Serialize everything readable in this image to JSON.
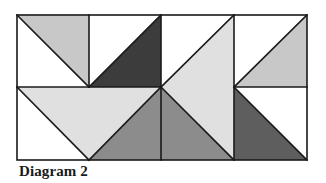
{
  "caption": "Diagram 2",
  "colors": {
    "white": "#ffffff",
    "light_grey": "#e0e0e0",
    "mid_light_grey": "#c8c8c8",
    "medium_grey": "#8c8c8c",
    "dark_grey": "#5e5e5e",
    "darkest_grey": "#3c3c3c",
    "line": "#1a1a1a"
  },
  "grid": {
    "x": [
      17,
      89,
      161,
      234,
      307
    ],
    "y": [
      15,
      87,
      160
    ]
  },
  "shapes": [
    {
      "name": "c1-top-white-triangle",
      "points": "17,15 89,87 17,87",
      "fill": "white"
    },
    {
      "name": "c1-top-grey-triangle",
      "points": "17,15 89,15 89,87",
      "fill": "mid_light_grey"
    },
    {
      "name": "c2-top-white-triangle",
      "points": "89,15 161,15 89,87",
      "fill": "white"
    },
    {
      "name": "c2-top-dark-triangle",
      "points": "161,15 161,87 89,87",
      "fill": "darkest_grey"
    },
    {
      "name": "c3-white-triangle",
      "points": "161,15 234,15 161,87",
      "fill": "white"
    },
    {
      "name": "c3-light-triangle",
      "points": "234,15 234,160 161,87",
      "fill": "light_grey"
    },
    {
      "name": "c3-medium-triangle",
      "points": "161,87 234,160 161,160",
      "fill": "medium_grey"
    },
    {
      "name": "c4-top-white-triangle",
      "points": "234,15 307,15 234,87",
      "fill": "white"
    },
    {
      "name": "c4-top-grey-triangle",
      "points": "307,15 307,87 234,87",
      "fill": "mid_light_grey"
    },
    {
      "name": "c4-bottom-white-triangle",
      "points": "234,87 307,87 307,160",
      "fill": "white"
    },
    {
      "name": "c4-bottom-dark-triangle",
      "points": "234,87 307,160 234,160",
      "fill": "dark_grey"
    },
    {
      "name": "bottom-left-white-triangle",
      "points": "17,87 89,160 17,160",
      "fill": "white"
    },
    {
      "name": "bottom-left-light-triangle",
      "points": "17,87 161,87 89,160",
      "fill": "light_grey"
    },
    {
      "name": "bottom-left-medium-triangle",
      "points": "161,87 161,160 89,160",
      "fill": "medium_grey"
    }
  ],
  "lines": [
    {
      "name": "outer-border",
      "type": "rect",
      "x": 17,
      "y": 15,
      "w": 290,
      "h": 145
    },
    {
      "name": "v-line-89-top",
      "x1": 89,
      "y1": 15,
      "x2": 89,
      "y2": 87
    },
    {
      "name": "v-line-161",
      "x1": 161,
      "y1": 15,
      "x2": 161,
      "y2": 160
    },
    {
      "name": "v-line-234",
      "x1": 234,
      "y1": 15,
      "x2": 234,
      "y2": 160
    },
    {
      "name": "h-line-left",
      "x1": 17,
      "y1": 87,
      "x2": 161,
      "y2": 87
    },
    {
      "name": "h-line-right",
      "x1": 234,
      "y1": 87,
      "x2": 307,
      "y2": 87
    },
    {
      "name": "diag-c1-top",
      "x1": 17,
      "y1": 15,
      "x2": 89,
      "y2": 87
    },
    {
      "name": "diag-c2-top",
      "x1": 161,
      "y1": 15,
      "x2": 89,
      "y2": 87
    },
    {
      "name": "diag-c3-top",
      "x1": 234,
      "y1": 15,
      "x2": 161,
      "y2": 87
    },
    {
      "name": "diag-c3-bottom",
      "x1": 161,
      "y1": 87,
      "x2": 234,
      "y2": 160
    },
    {
      "name": "diag-c4-top",
      "x1": 307,
      "y1": 15,
      "x2": 234,
      "y2": 87
    },
    {
      "name": "diag-c4-bottom",
      "x1": 234,
      "y1": 87,
      "x2": 307,
      "y2": 160
    },
    {
      "name": "diag-bottom-left-1",
      "x1": 17,
      "y1": 87,
      "x2": 89,
      "y2": 160
    },
    {
      "name": "diag-bottom-left-2",
      "x1": 161,
      "y1": 87,
      "x2": 89,
      "y2": 160
    }
  ]
}
